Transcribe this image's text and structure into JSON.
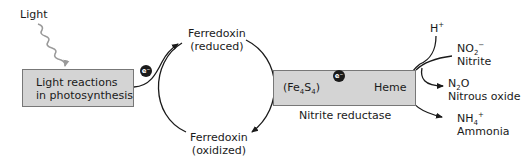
{
  "diagram": {
    "light_label": "Light",
    "light_box": {
      "line1": "Light reactions",
      "line2": "in photosynthesis"
    },
    "electron_label": "e⁻",
    "ferredoxin_reduced": {
      "line1": "Ferredoxin",
      "line2": "(reduced)"
    },
    "ferredoxin_oxidized": {
      "line1": "Ferredoxin",
      "line2": "(oxidized)"
    },
    "enzyme_box": {
      "cofactor_prefix": "(Fe",
      "cofactor_sub1": "4",
      "cofactor_mid": "S",
      "cofactor_sub2": "4",
      "cofactor_suffix": ")",
      "heme": "Heme",
      "caption": "Nitrite reductase"
    },
    "proton": {
      "base": "H",
      "sup": "+"
    },
    "nitrite": {
      "formula_base": "NO",
      "formula_sub": "2",
      "formula_sup": "−",
      "name": "Nitrite"
    },
    "nitrous_oxide": {
      "formula_pre": "N",
      "formula_sub": "2",
      "formula_post": "O",
      "name": "Nitrous oxide"
    },
    "ammonia": {
      "formula_base": "NH",
      "formula_sub": "4",
      "formula_sup": "+",
      "name": "Ammonia"
    },
    "colors": {
      "box_fill": "#d4d4d4",
      "box_border": "#777777",
      "light_wave": "#9a9a9a",
      "line": "#1a1a1a"
    }
  }
}
